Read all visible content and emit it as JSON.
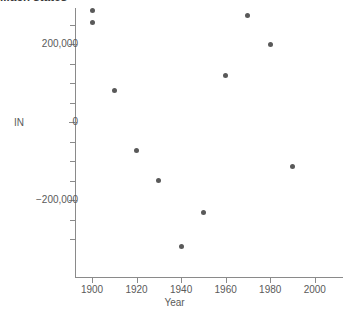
{
  "chart_data": {
    "type": "scatter",
    "title": "...ach states",
    "xlabel": "Year",
    "ylabel": "IN",
    "xlim": [
      1888,
      2008
    ],
    "ylim": [
      -340000,
      300000
    ],
    "grid": false,
    "legend": false,
    "x_ticks": [
      1900,
      1920,
      1940,
      1960,
      1980,
      2000
    ],
    "x_tick_labels": [
      "1900",
      "1920",
      "1940",
      "1960",
      "1980",
      "2000"
    ],
    "y_ticks": [
      200000,
      0,
      -200000
    ],
    "y_tick_labels": [
      "200,000",
      "0",
      "−200,000"
    ],
    "y_minor_tick_step": 50000,
    "point_color": "#595959",
    "axis_color": "#8a8a8a",
    "x": [
      1900,
      1900,
      1910,
      1920,
      1930,
      1940,
      1950,
      1960,
      1970,
      1980,
      1990
    ],
    "values": [
      285000,
      256000,
      79500,
      -74000,
      -151000,
      -320000,
      -231000,
      120500,
      274000,
      197500,
      -113000
    ],
    "points": [
      {
        "x": 1900,
        "y": 285000
      },
      {
        "x": 1900,
        "y": 256000
      },
      {
        "x": 1910,
        "y": 79500
      },
      {
        "x": 1920,
        "y": -74000
      },
      {
        "x": 1930,
        "y": -151000
      },
      {
        "x": 1940,
        "y": -320000
      },
      {
        "x": 1950,
        "y": -231000
      },
      {
        "x": 1960,
        "y": 120500
      },
      {
        "x": 1970,
        "y": 274000
      },
      {
        "x": 1980,
        "y": 197500
      },
      {
        "x": 1990,
        "y": -113000
      }
    ]
  }
}
